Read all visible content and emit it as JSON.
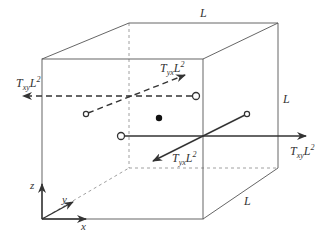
{
  "diagram": {
    "title": "",
    "edge_labels": {
      "top": "L",
      "right": "L",
      "depth": "L"
    },
    "forces": {
      "left_dashed": {
        "T": "T",
        "sub": "xy",
        "L": "L",
        "sup": "2"
      },
      "back_dashed": {
        "T": "T",
        "sub": "yx",
        "L": "L",
        "sup": "2"
      },
      "front_solid": {
        "T": "T",
        "sub": "yx",
        "L": "L",
        "sup": "2"
      },
      "right_solid": {
        "T": "T",
        "sub": "xy",
        "L": "L",
        "sup": "2"
      }
    },
    "axes": {
      "x": "x",
      "y": "y",
      "z": "z"
    },
    "colors": {
      "edge": "#555555",
      "hidden_edge": "#888888",
      "force": "#333333",
      "background": "#ffffff"
    }
  }
}
